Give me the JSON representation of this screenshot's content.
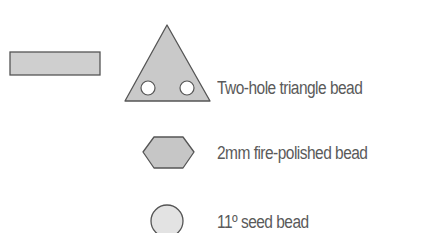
{
  "legend": {
    "items": [
      {
        "shape": "rectangle",
        "label": ""
      },
      {
        "shape": "triangle-two-hole",
        "label": "Two-hole triangle bead"
      },
      {
        "shape": "hexagon",
        "label": "2mm fire-polished bead"
      },
      {
        "shape": "circle",
        "label": "11º seed bead"
      }
    ]
  },
  "colors": {
    "fill_dark": "#c8c8c8",
    "fill_light": "#e3e3e3",
    "stroke": "#555555",
    "text": "#5a5a5a"
  }
}
